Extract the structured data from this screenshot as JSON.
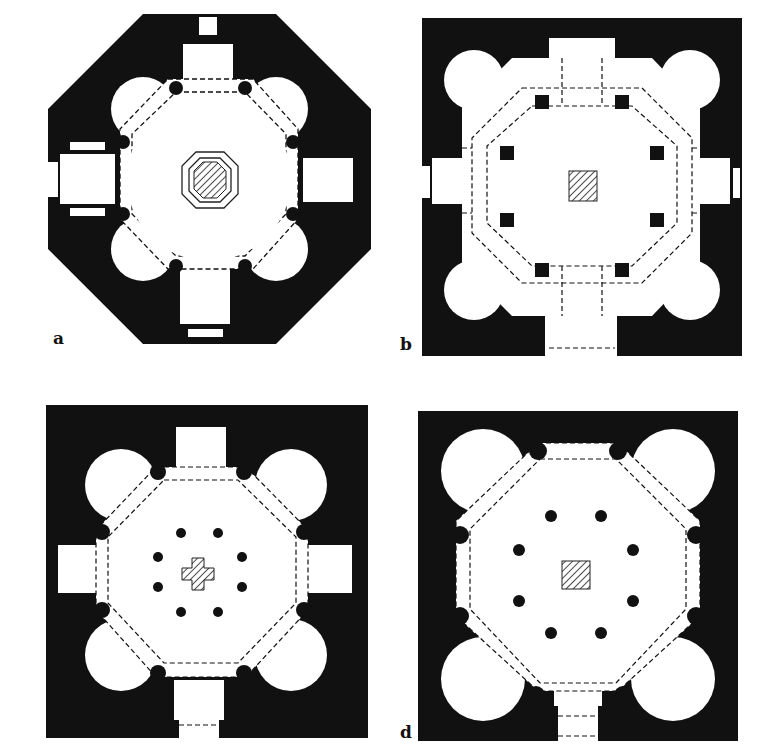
{
  "figure": {
    "type": "architectural floor plans",
    "panels": [
      {
        "id": "a",
        "label": "a",
        "outline": "octagon",
        "central_feature": "hatched octagon within double octagon outline",
        "piers": 8,
        "inner_columns": 0,
        "entrances": 4,
        "apses": 4
      },
      {
        "id": "b",
        "label": "b",
        "outline": "square",
        "central_feature": "hatched square",
        "piers": 8,
        "inner_columns": 0,
        "entrances": 4,
        "apses": 4
      },
      {
        "id": "c",
        "label": "c",
        "outline": "square",
        "central_feature": "hatched cross",
        "piers": 8,
        "inner_columns": 8,
        "entrances": 4,
        "apses": 4
      },
      {
        "id": "d",
        "label": "d",
        "outline": "square",
        "central_feature": "hatched square",
        "piers": 8,
        "inner_columns": 8,
        "entrances": 1,
        "apses": 4
      }
    ],
    "colors": {
      "wall": "#111111",
      "floor": "#ffffff",
      "hatch": "#222222"
    }
  }
}
